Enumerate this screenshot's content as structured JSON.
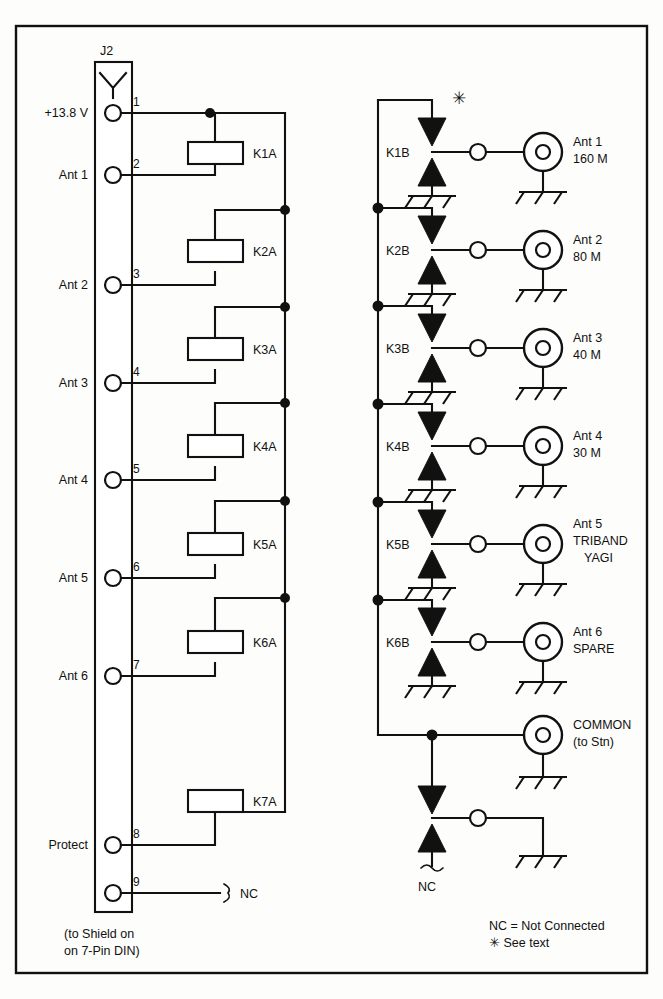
{
  "diagram": {
    "connector": {
      "name": "J2",
      "footnote_line1": "(to Shield on",
      "footnote_line2": "on 7-Pin DIN)"
    },
    "pins": [
      {
        "number": "1",
        "label": "+13.8 V"
      },
      {
        "number": "2",
        "label": "Ant 1"
      },
      {
        "number": "3",
        "label": "Ant 2"
      },
      {
        "number": "4",
        "label": "Ant 3"
      },
      {
        "number": "5",
        "label": "Ant 4"
      },
      {
        "number": "6",
        "label": "Ant 5"
      },
      {
        "number": "7",
        "label": "Ant 6"
      },
      {
        "number": "8",
        "label": "Protect"
      },
      {
        "number": "9",
        "label": ""
      }
    ],
    "pin9_note": "NC",
    "coils": [
      {
        "name": "K1A"
      },
      {
        "name": "K2A"
      },
      {
        "name": "K3A"
      },
      {
        "name": "K4A"
      },
      {
        "name": "K5A"
      },
      {
        "name": "K6A"
      },
      {
        "name": "K7A"
      }
    ],
    "contacts": [
      {
        "name": "K1B",
        "ant_line1": "Ant 1",
        "ant_line2": "160 M",
        "ant_line3": ""
      },
      {
        "name": "K2B",
        "ant_line1": "Ant 2",
        "ant_line2": "80 M",
        "ant_line3": ""
      },
      {
        "name": "K3B",
        "ant_line1": "Ant 3",
        "ant_line2": "40 M",
        "ant_line3": ""
      },
      {
        "name": "K4B",
        "ant_line1": "Ant 4",
        "ant_line2": "30 M",
        "ant_line3": ""
      },
      {
        "name": "K5B",
        "ant_line1": "Ant 5",
        "ant_line2": "TRIBAND",
        "ant_line3": "YAGI"
      },
      {
        "name": "K6B",
        "ant_line1": "Ant 6",
        "ant_line2": "SPARE",
        "ant_line3": ""
      }
    ],
    "common": {
      "line1": "COMMON",
      "line2": "(to Stn)",
      "nc_label": "NC"
    },
    "star_marker": "✳",
    "legend": {
      "line1": "NC = Not Connected",
      "line2": "✳ See text"
    },
    "colors": {
      "ink": "#111111",
      "paper": "#fdfdfb"
    }
  }
}
